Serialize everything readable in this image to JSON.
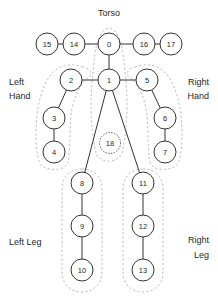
{
  "figure": {
    "background": "#ffffff",
    "node_stroke": "#333333",
    "node_fill": "#ffffff",
    "edge_color": "#333333",
    "region_color": "#bdbdbd"
  },
  "group_labels": [
    {
      "id": "torso",
      "text": "Torso",
      "x": 109,
      "y": 16,
      "align": "middle"
    },
    {
      "id": "left-hand",
      "text": "Left",
      "x": 9,
      "y": 85,
      "align": "start"
    },
    {
      "id": "left-hand2",
      "text": "Hand",
      "x": 9,
      "y": 99,
      "align": "start"
    },
    {
      "id": "right-hand",
      "text": "Right",
      "x": 209,
      "y": 85,
      "align": "end"
    },
    {
      "id": "right-hand2",
      "text": "Hand",
      "x": 209,
      "y": 99,
      "align": "end"
    },
    {
      "id": "left-leg",
      "text": "Left Leg",
      "x": 9,
      "y": 245,
      "align": "start"
    },
    {
      "id": "right-leg",
      "text": "Right",
      "x": 209,
      "y": 243,
      "align": "end"
    },
    {
      "id": "right-leg2",
      "text": "Leg",
      "x": 209,
      "y": 258,
      "align": "end"
    }
  ],
  "nodes": [
    {
      "id": 0,
      "label": "0",
      "x": 109,
      "y": 44,
      "r": 11,
      "style": "solid"
    },
    {
      "id": 1,
      "label": "1",
      "x": 109,
      "y": 80,
      "r": 11,
      "style": "solid"
    },
    {
      "id": 2,
      "label": "2",
      "x": 71,
      "y": 80,
      "r": 11,
      "style": "solid"
    },
    {
      "id": 3,
      "label": "3",
      "x": 54,
      "y": 118,
      "r": 11,
      "style": "solid"
    },
    {
      "id": 4,
      "label": "4",
      "x": 54,
      "y": 152,
      "r": 11,
      "style": "solid"
    },
    {
      "id": 5,
      "label": "5",
      "x": 147,
      "y": 80,
      "r": 11,
      "style": "solid"
    },
    {
      "id": 6,
      "label": "6",
      "x": 165,
      "y": 118,
      "r": 11,
      "style": "solid"
    },
    {
      "id": 7,
      "label": "7",
      "x": 165,
      "y": 152,
      "r": 11,
      "style": "solid"
    },
    {
      "id": 8,
      "label": "8",
      "x": 82,
      "y": 183,
      "r": 11,
      "style": "solid"
    },
    {
      "id": 9,
      "label": "9",
      "x": 82,
      "y": 226,
      "r": 11,
      "style": "solid"
    },
    {
      "id": 10,
      "label": "10",
      "x": 82,
      "y": 270,
      "r": 11,
      "style": "solid"
    },
    {
      "id": 11,
      "label": "11",
      "x": 143,
      "y": 183,
      "r": 11,
      "style": "solid"
    },
    {
      "id": 12,
      "label": "12",
      "x": 143,
      "y": 226,
      "r": 11,
      "style": "solid"
    },
    {
      "id": 13,
      "label": "13",
      "x": 143,
      "y": 270,
      "r": 11,
      "style": "solid"
    },
    {
      "id": 14,
      "label": "14",
      "x": 74,
      "y": 44,
      "r": 11,
      "style": "solid"
    },
    {
      "id": 15,
      "label": "15",
      "x": 47,
      "y": 44,
      "r": 11,
      "style": "solid"
    },
    {
      "id": 16,
      "label": "16",
      "x": 144,
      "y": 44,
      "r": 11,
      "style": "solid"
    },
    {
      "id": 17,
      "label": "17",
      "x": 171,
      "y": 44,
      "r": 11,
      "style": "solid"
    },
    {
      "id": 18,
      "label": "18",
      "x": 110,
      "y": 143,
      "r": 10.5,
      "style": "dotted"
    }
  ],
  "edges": [
    {
      "from": 15,
      "to": 14
    },
    {
      "from": 14,
      "to": 0
    },
    {
      "from": 0,
      "to": 16
    },
    {
      "from": 16,
      "to": 17
    },
    {
      "from": 0,
      "to": 1
    },
    {
      "from": 2,
      "to": 1
    },
    {
      "from": 1,
      "to": 5
    },
    {
      "from": 2,
      "to": 3
    },
    {
      "from": 3,
      "to": 4
    },
    {
      "from": 5,
      "to": 6
    },
    {
      "from": 6,
      "to": 7
    },
    {
      "from": 1,
      "to": 8
    },
    {
      "from": 8,
      "to": 9
    },
    {
      "from": 9,
      "to": 10
    },
    {
      "from": 1,
      "to": 11
    },
    {
      "from": 11,
      "to": 12
    },
    {
      "from": 12,
      "to": 13
    }
  ],
  "regions": [
    {
      "id": "torso-region",
      "d": "M 96 153 C 90 126 90 98 93 72 C 95 48 98 30 109 28 C 120 30 123 48 125 72 C 128 98 128 126 122 153 C 118 164 100 164 96 153 Z"
    },
    {
      "id": "left-hand-region",
      "d": "M 83 67 C 70 62 57 66 50 76 C 41 88 36 110 36 134 C 36 150 38 163 42 166 C 52 172 66 170 68 162 C 71 146 69 124 72 108 C 76 90 84 80 90 76 C 92 72 89 68 83 67 Z"
    },
    {
      "id": "right-hand-region",
      "d": "M 135 67 C 148 62 161 66 168 76 C 177 88 182 110 182 134 C 182 150 180 163 176 166 C 166 172 152 170 150 162 C 147 146 149 124 146 108 C 142 90 134 80 128 76 C 126 72 129 68 135 67 Z"
    },
    {
      "id": "left-leg-region",
      "d": "M 82 169 C 70 169 62 177 62 189 L 62 272 C 62 284 70 292 82 292 C 94 292 102 284 102 272 L 102 189 C 102 177 94 169 82 169 Z"
    },
    {
      "id": "right-leg-region",
      "d": "M 143 169 C 131 169 123 177 123 189 L 123 272 C 123 284 131 292 143 292 C 155 292 163 284 163 272 L 163 189 C 163 177 155 169 143 169 Z"
    }
  ]
}
